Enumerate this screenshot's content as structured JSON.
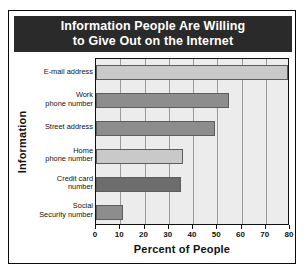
{
  "chart_data": {
    "type": "bar",
    "orientation": "horizontal",
    "title": "Information People Are Willing to Give Out on the Internet",
    "title_lines": [
      "Information People Are Willing",
      "to Give Out on the Internet"
    ],
    "xlabel": "Percent of People",
    "ylabel": "Information",
    "categories": [
      "E-mail address",
      "Work phone number",
      "Street address",
      "Home phone number",
      "Credit card number",
      "Social Security number"
    ],
    "category_lines": [
      [
        "E-mail address"
      ],
      [
        "Work",
        "phone number"
      ],
      [
        "Street address"
      ],
      [
        "Home",
        "phone number"
      ],
      [
        "Credit card",
        "number"
      ],
      [
        "Social",
        "Security number"
      ]
    ],
    "values": [
      79,
      55,
      49,
      36,
      35,
      11
    ],
    "bar_colors": [
      "#c9c9c9",
      "#8d8d8d",
      "#8d8d8d",
      "#c9c9c9",
      "#6d6d6d",
      "#8d8d8d"
    ],
    "xlim": [
      0,
      80
    ],
    "xticks": [
      0,
      10,
      20,
      30,
      40,
      50,
      60,
      70,
      80
    ],
    "xticklabels": [
      "0",
      "10",
      "20",
      "30",
      "40",
      "50",
      "60",
      "70",
      "80"
    ],
    "grid": "vertical",
    "legend": "none",
    "plot_background": "#ececec",
    "title_background": "#2a2a2a",
    "title_color": "#ffffff"
  }
}
